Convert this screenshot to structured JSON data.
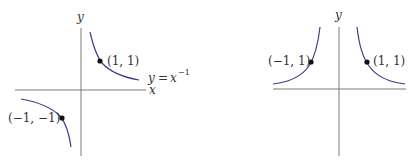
{
  "colors": {
    "axis": "#7a7a7a",
    "curve": "#3b3e8c",
    "point": "#111111",
    "text": "#333333"
  },
  "left_graph": {
    "x_axis_label": "x",
    "y_axis_label": "y",
    "equation": {
      "lhs": "y",
      "eq": "=",
      "base": "x",
      "exponent": "−1"
    },
    "points": [
      {
        "label": "(1, 1)",
        "x": 1,
        "y": 1
      },
      {
        "label": "(−1, −1)",
        "x": -1,
        "y": -1
      }
    ]
  },
  "right_graph": {
    "y_axis_label": "y",
    "points": [
      {
        "label": "(−1, 1)",
        "x": -1,
        "y": 1
      },
      {
        "label": "(1, 1)",
        "x": 1,
        "y": 1
      }
    ]
  }
}
